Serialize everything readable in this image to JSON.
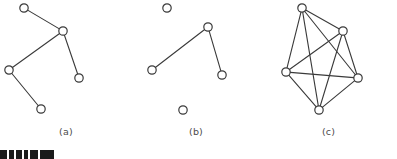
{
  "figure": {
    "background_color": "#ffffff",
    "node_stroke_color": "#3a3a3a",
    "node_fill_color": "#ffffff",
    "edge_color": "#3a3a3a",
    "caption_color": "#4c4c4c",
    "node_radius": 4.2,
    "panels": [
      {
        "id": "panel-a",
        "caption": "(a)",
        "description": "tree-graph-five-nodes",
        "origin": [
          0,
          0
        ],
        "nodes": [
          {
            "id": "a1",
            "x": 24,
            "y": 8
          },
          {
            "id": "a2",
            "x": 63,
            "y": 31
          },
          {
            "id": "a3",
            "x": 9,
            "y": 70
          },
          {
            "id": "a4",
            "x": 41,
            "y": 109
          },
          {
            "id": "a5",
            "x": 79,
            "y": 78
          }
        ],
        "edges": [
          [
            "a1",
            "a2"
          ],
          [
            "a2",
            "a3"
          ],
          [
            "a2",
            "a5"
          ],
          [
            "a3",
            "a4"
          ]
        ]
      },
      {
        "id": "panel-b",
        "caption": "(b)",
        "description": "graph-with-two-isolated-nodes-and-three-node-path",
        "origin": [
          132,
          0
        ],
        "nodes": [
          {
            "id": "b1",
            "x": 35,
            "y": 8
          },
          {
            "id": "b2",
            "x": 76,
            "y": 27
          },
          {
            "id": "b3",
            "x": 20,
            "y": 70
          },
          {
            "id": "b4",
            "x": 90,
            "y": 75
          },
          {
            "id": "b5",
            "x": 51,
            "y": 110
          }
        ],
        "edges": [
          [
            "b2",
            "b3"
          ],
          [
            "b2",
            "b4"
          ]
        ]
      },
      {
        "id": "panel-c",
        "caption": "(c)",
        "description": "complete-graph-k5",
        "origin": [
          260,
          0
        ],
        "nodes": [
          {
            "id": "c1",
            "x": 42,
            "y": 8
          },
          {
            "id": "c2",
            "x": 83,
            "y": 31
          },
          {
            "id": "c3",
            "x": 26,
            "y": 72
          },
          {
            "id": "c4",
            "x": 98,
            "y": 78
          },
          {
            "id": "c5",
            "x": 59,
            "y": 110
          }
        ],
        "edges": [
          [
            "c1",
            "c2"
          ],
          [
            "c1",
            "c3"
          ],
          [
            "c1",
            "c4"
          ],
          [
            "c1",
            "c5"
          ],
          [
            "c2",
            "c3"
          ],
          [
            "c2",
            "c4"
          ],
          [
            "c2",
            "c5"
          ],
          [
            "c3",
            "c4"
          ],
          [
            "c3",
            "c5"
          ],
          [
            "c4",
            "c5"
          ]
        ]
      }
    ]
  },
  "bottom_strip": {
    "description": "partial-dark-toolbar-fragment",
    "color": "#1a1a1a",
    "segments": [
      {
        "x": 0,
        "y": 0,
        "w": 7,
        "h": 9
      },
      {
        "x": 9,
        "y": 0,
        "w": 5,
        "h": 9
      },
      {
        "x": 16,
        "y": 0,
        "w": 6,
        "h": 9
      },
      {
        "x": 24,
        "y": 0,
        "w": 4,
        "h": 9
      },
      {
        "x": 30,
        "y": 0,
        "w": 8,
        "h": 9
      },
      {
        "x": 40,
        "y": 0,
        "w": 14,
        "h": 9
      }
    ]
  }
}
